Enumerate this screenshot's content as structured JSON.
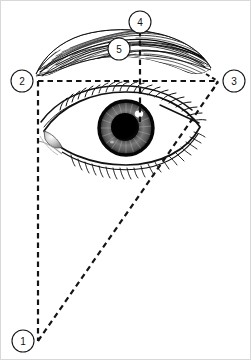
{
  "figure": {
    "title": "Eyebrow and eye proportion reference diagram",
    "background_color": "#ffffff",
    "ink_color": "#111111",
    "dash_color": "#141414",
    "border_color": "#d8d8d8",
    "width": 251,
    "height": 360
  },
  "markers": [
    {
      "id": "marker-1",
      "label": "1",
      "cx": 23,
      "cy": 341,
      "r": 11,
      "description": "apex point below the eye where the vertical and oblique construction lines converge"
    },
    {
      "id": "marker-2",
      "label": "2",
      "cx": 22,
      "cy": 81,
      "r": 11,
      "description": "left end of the horizontal construction line at the inner canthus vertical"
    },
    {
      "id": "marker-3",
      "label": "3",
      "cx": 234,
      "cy": 81,
      "r": 11,
      "description": "right end of the horizontal construction line at the brow tail"
    },
    {
      "id": "marker-4",
      "label": "4",
      "cx": 140,
      "cy": 22,
      "r": 11,
      "description": "top of the vertical construction line above the brow arch"
    },
    {
      "id": "marker-5",
      "label": "5",
      "cx": 119,
      "cy": 49,
      "r": 11,
      "description": "brow arch highest point marker on the eyebrow"
    }
  ],
  "construction_lines": [
    {
      "name": "horizontal-baseline",
      "style": "dashed",
      "from": [
        38,
        81
      ],
      "to": [
        218,
        81
      ]
    },
    {
      "name": "vertical-left-line",
      "style": "dashed",
      "from": [
        38,
        81
      ],
      "to": [
        38,
        340
      ]
    },
    {
      "name": "oblique-line",
      "style": "dashed",
      "from": [
        38,
        340
      ],
      "to": [
        218,
        82
      ]
    },
    {
      "name": "vertical-pupil-line",
      "style": "dashed",
      "from": [
        140,
        31
      ],
      "to": [
        140,
        122
      ]
    }
  ],
  "anatomy": [
    {
      "name": "eyebrow",
      "description": "hatched eyebrow with fine hair strokes arching across the top"
    },
    {
      "name": "upper-eyelid-crease",
      "description": "upper lid fold curve"
    },
    {
      "name": "upper-lash-line",
      "description": "upper eyelash row"
    },
    {
      "name": "lower-lash-line",
      "description": "lower eyelash row"
    },
    {
      "name": "iris",
      "description": "radially striated grey iris"
    },
    {
      "name": "pupil",
      "description": "solid black pupil"
    },
    {
      "name": "corneal-highlight",
      "description": "white specular highlight on upper right of iris"
    },
    {
      "name": "lacrimal-caruncle",
      "description": "tear duct at the inner canthus"
    },
    {
      "name": "lateral-canthus-line",
      "description": "short solid line through the outer eye corner"
    }
  ]
}
